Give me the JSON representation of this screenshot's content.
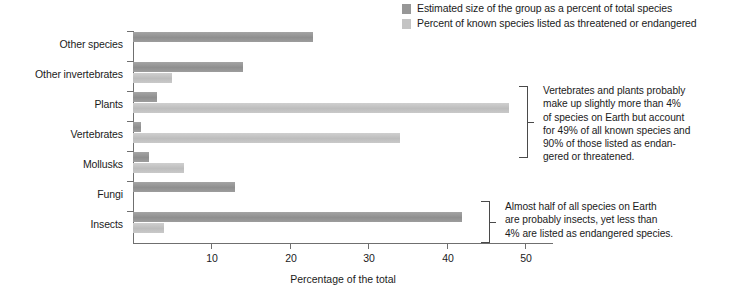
{
  "legend": {
    "items": [
      {
        "label": "Estimated size of the group as a percent of total species",
        "color": "#979797",
        "swatch_name": "legend-swatch-estimated-size"
      },
      {
        "label": "Percent of known species listed as threatened or endangered",
        "color": "#c4c4c4",
        "swatch_name": "legend-swatch-percent-known"
      }
    ]
  },
  "axis": {
    "x_title": "Percentage of the total",
    "x_ticks": [
      "10",
      "20",
      "30",
      "40",
      "50"
    ]
  },
  "annotations": [
    {
      "id": "annotation-vertebrates-plants",
      "lines": [
        "Vertebrates and plants probably",
        "make up slightly more than 4%",
        "of species on Earth but account",
        "for 49% of all known species and",
        "90% of those listed as endan-",
        "gered or threatened."
      ]
    },
    {
      "id": "annotation-insects",
      "lines": [
        "Almost half of all species on Earth",
        "are probably insects, yet less than",
        "4% are listed as endangered species."
      ]
    }
  ],
  "chart_data": {
    "type": "bar",
    "orientation": "horizontal",
    "title": "",
    "xlabel": "Percentage of the total",
    "ylabel": "",
    "xlim": [
      0,
      53.5
    ],
    "grid": false,
    "legend_position": "top-right",
    "categories": [
      "Other species",
      "Other invertebrates",
      "Plants",
      "Vertebrates",
      "Mollusks",
      "Fungi",
      "Insects"
    ],
    "series": [
      {
        "name": "Estimated size of the group as a percent of total species",
        "color": "#979797",
        "values": [
          23,
          14,
          3,
          1,
          2,
          13,
          42
        ]
      },
      {
        "name": "Percent of known species listed as threatened or endangered",
        "color": "#c4c4c4",
        "values": [
          0,
          5,
          48,
          34,
          6.5,
          0,
          4
        ]
      }
    ]
  }
}
